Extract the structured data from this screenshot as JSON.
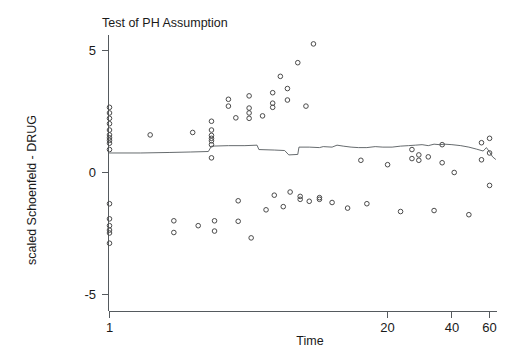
{
  "chart_data": {
    "type": "scatter",
    "title": "Test of PH Assumption",
    "xlabel": "Time",
    "ylabel": "scaled Schoenfeld - DRUG",
    "xscale": "log",
    "yscale": "linear",
    "xlim": [
      1,
      65
    ],
    "ylim": [
      -5.6,
      5.6
    ],
    "grid": false,
    "legend": null,
    "xticks": [
      1,
      20,
      40,
      60
    ],
    "xtick_labels": [
      "1",
      "20",
      "40",
      "60"
    ],
    "yticks": [
      5,
      0,
      -5
    ],
    "ytick_labels": [
      "5",
      "0",
      "-5"
    ],
    "series": [
      {
        "name": "scaled Schoenfeld residuals",
        "marker": "open-circle",
        "marker_color": "#4a4a4a",
        "points": [
          [
            1.0,
            2.65
          ],
          [
            1.0,
            2.42
          ],
          [
            1.0,
            2.2
          ],
          [
            1.0,
            1.98
          ],
          [
            1.0,
            1.72
          ],
          [
            1.0,
            1.52
          ],
          [
            1.0,
            1.4
          ],
          [
            1.0,
            1.3
          ],
          [
            1.0,
            1.18
          ],
          [
            1.0,
            0.92
          ],
          [
            1.0,
            -1.3
          ],
          [
            1.0,
            -1.92
          ],
          [
            1.0,
            -2.2
          ],
          [
            1.0,
            -2.38
          ],
          [
            1.0,
            -2.5
          ],
          [
            1.0,
            -2.92
          ],
          [
            1.55,
            1.52
          ],
          [
            2.0,
            -2.0
          ],
          [
            2.0,
            -2.48
          ],
          [
            2.45,
            1.62
          ],
          [
            2.6,
            -2.2
          ],
          [
            3.0,
            2.08
          ],
          [
            3.0,
            1.72
          ],
          [
            3.0,
            1.5
          ],
          [
            3.0,
            1.38
          ],
          [
            3.0,
            1.28
          ],
          [
            3.0,
            1.12
          ],
          [
            3.0,
            0.58
          ],
          [
            3.1,
            -2.0
          ],
          [
            3.1,
            -2.42
          ],
          [
            3.6,
            2.98
          ],
          [
            3.6,
            2.7
          ],
          [
            3.9,
            2.22
          ],
          [
            4.0,
            -1.18
          ],
          [
            4.0,
            -2.02
          ],
          [
            4.5,
            3.12
          ],
          [
            4.5,
            2.62
          ],
          [
            4.5,
            2.42
          ],
          [
            4.5,
            2.2
          ],
          [
            4.6,
            -2.7
          ],
          [
            5.2,
            2.3
          ],
          [
            5.4,
            -1.55
          ],
          [
            5.8,
            3.25
          ],
          [
            5.8,
            2.82
          ],
          [
            5.8,
            2.65
          ],
          [
            5.9,
            -0.95
          ],
          [
            6.3,
            3.92
          ],
          [
            6.5,
            -1.42
          ],
          [
            6.8,
            3.42
          ],
          [
            6.8,
            2.95
          ],
          [
            7.0,
            -0.82
          ],
          [
            7.6,
            4.48
          ],
          [
            7.8,
            -1.0
          ],
          [
            7.8,
            -1.12
          ],
          [
            8.3,
            2.7
          ],
          [
            8.6,
            -1.2
          ],
          [
            9.0,
            5.25
          ],
          [
            9.6,
            -1.05
          ],
          [
            9.6,
            -1.12
          ],
          [
            11.0,
            -1.25
          ],
          [
            13.0,
            -1.48
          ],
          [
            15.0,
            0.48
          ],
          [
            16.0,
            -1.3
          ],
          [
            20.0,
            0.3
          ],
          [
            23.0,
            -1.62
          ],
          [
            26.0,
            0.92
          ],
          [
            26.0,
            0.55
          ],
          [
            28.0,
            0.7
          ],
          [
            28.0,
            0.48
          ],
          [
            31.0,
            0.62
          ],
          [
            33.0,
            -1.58
          ],
          [
            36.0,
            1.12
          ],
          [
            36.0,
            0.38
          ],
          [
            41.0,
            -0.02
          ],
          [
            48.0,
            -1.75
          ],
          [
            55.0,
            1.2
          ],
          [
            55.0,
            0.5
          ],
          [
            60.0,
            1.38
          ],
          [
            60.0,
            0.78
          ],
          [
            60.0,
            -0.55
          ]
        ]
      }
    ],
    "smoother": {
      "name": "spline fit",
      "style": "solid",
      "color": "#555a5e",
      "points": [
        [
          1.0,
          0.78
        ],
        [
          1.4,
          0.78
        ],
        [
          1.9,
          0.8
        ],
        [
          2.4,
          0.82
        ],
        [
          2.9,
          0.84
        ],
        [
          3.0,
          1.06
        ],
        [
          3.6,
          1.08
        ],
        [
          4.3,
          1.08
        ],
        [
          4.9,
          1.1
        ],
        [
          5.0,
          0.92
        ],
        [
          5.9,
          0.9
        ],
        [
          6.6,
          0.88
        ],
        [
          6.9,
          0.7
        ],
        [
          7.6,
          0.72
        ],
        [
          7.7,
          1.02
        ],
        [
          8.6,
          1.02
        ],
        [
          9.6,
          1.0
        ],
        [
          10.0,
          1.04
        ],
        [
          11.0,
          1.02
        ],
        [
          11.6,
          1.1
        ],
        [
          12.4,
          1.06
        ],
        [
          13.5,
          1.02
        ],
        [
          14.6,
          1.0
        ],
        [
          16.0,
          1.0
        ],
        [
          17.5,
          1.04
        ],
        [
          19.0,
          1.02
        ],
        [
          21.0,
          1.02
        ],
        [
          23.0,
          1.06
        ],
        [
          25.0,
          1.08
        ],
        [
          27.0,
          1.1
        ],
        [
          29.0,
          1.12
        ],
        [
          31.0,
          1.08
        ],
        [
          33.0,
          1.14
        ],
        [
          35.0,
          1.12
        ],
        [
          37.0,
          1.14
        ],
        [
          40.0,
          1.12
        ],
        [
          44.0,
          1.08
        ],
        [
          48.0,
          1.02
        ],
        [
          52.0,
          0.94
        ],
        [
          56.0,
          0.86
        ],
        [
          58.0,
          1.0
        ],
        [
          60.0,
          0.82
        ],
        [
          62.0,
          0.62
        ],
        [
          64.0,
          0.52
        ]
      ]
    }
  }
}
